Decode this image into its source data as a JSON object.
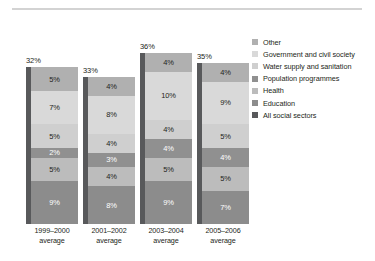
{
  "chart_data": {
    "type": "bar",
    "subtype": "stacked-bar",
    "title": "",
    "subtitle": "",
    "xlabel": "",
    "ylabel": "",
    "grid": false,
    "ylim": [
      0,
      40
    ],
    "legend_position": "right",
    "categories": [
      "1999–2000\naverage",
      "2001–2002\naverage",
      "2003–2004\naverage",
      "2005–2006\naverage"
    ],
    "category_lines": [
      [
        "1999–2000",
        "average"
      ],
      [
        "2001–2002",
        "average"
      ],
      [
        "2003–2004",
        "average"
      ],
      [
        "2005–2006",
        "average"
      ]
    ],
    "totals": [
      32,
      33,
      36,
      35
    ],
    "total_labels": [
      "32%",
      "33%",
      "36%",
      "35%"
    ],
    "series": [
      {
        "name": "Education",
        "color": "#8c8c8c",
        "values": [
          9,
          8,
          9,
          7
        ],
        "labels": [
          "9%",
          "8%",
          "9%",
          "7%"
        ],
        "label_color": "#ffffff"
      },
      {
        "name": "Health",
        "color": "#bcbcbc",
        "values": [
          5,
          4,
          5,
          5
        ],
        "labels": [
          "5%",
          "4%",
          "5%",
          "5%"
        ],
        "label_color": "#231f20"
      },
      {
        "name": "Population programmes",
        "color": "#909090",
        "values": [
          2,
          3,
          4,
          4
        ],
        "labels": [
          "2%",
          "3%",
          "4%",
          "4%"
        ],
        "label_color": "#ffffff"
      },
      {
        "name": "Water supply and sanitation",
        "color": "#cfcfcf",
        "values": [
          5,
          4,
          4,
          5
        ],
        "labels": [
          "5%",
          "4%",
          "4%",
          "5%"
        ],
        "label_color": "#231f20"
      },
      {
        "name": "Government and civil society",
        "color": "#d9d9d9",
        "values": [
          7,
          8,
          10,
          9
        ],
        "labels": [
          "7%",
          "8%",
          "10%",
          "9%"
        ],
        "label_color": "#231f20"
      },
      {
        "name": "Other",
        "color": "#b0b0b0",
        "values": [
          5,
          4,
          4,
          4
        ],
        "labels": [
          "5%",
          "4%",
          "4%",
          "4%"
        ],
        "label_color": "#231f20"
      }
    ],
    "spine_series": {
      "name": "All social sectors",
      "color": "#58595b"
    },
    "legend": [
      {
        "label": "Other",
        "color": "#b0b0b0"
      },
      {
        "label": "Government and civil society",
        "color": "#d9d9d9"
      },
      {
        "label": "Water supply and sanitation",
        "color": "#cfcfcf"
      },
      {
        "label": "Population programmes",
        "color": "#909090"
      },
      {
        "label": "Health",
        "color": "#bcbcbc"
      },
      {
        "label": "Education",
        "color": "#8c8c8c"
      },
      {
        "label": "All social sectors",
        "color": "#58595b"
      }
    ]
  }
}
